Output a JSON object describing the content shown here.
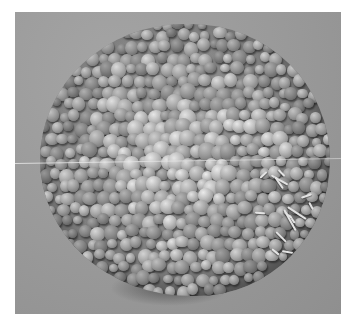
{
  "image": {
    "description": "Grayscale scanning electron micrograph of a roughly spherical aggregate of rounded cells",
    "colors": {
      "border": "#ffffff",
      "background": "#9a9a9a",
      "cell_highlight": "#d2d2d2",
      "cell_shadow": "#6e6e6e",
      "scanline": "#e8e8e8"
    }
  }
}
